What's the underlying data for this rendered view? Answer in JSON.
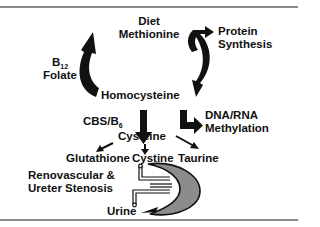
{
  "diagram": {
    "nodes": {
      "diet_line1": "Diet",
      "diet_line2": "Methionine",
      "protein_line1": "Protein",
      "protein_line2": "Synthesis",
      "b12_base": "B",
      "b12_sub": "12",
      "folate": "Folate",
      "homocysteine": "Homocysteine",
      "cbs_base": "CBS/B",
      "cbs_sub": "6",
      "dna_line1": "DNA/RNA",
      "dna_line2": "Methylation",
      "cysteine": "Cysteine",
      "glutathione": "Glutathione",
      "cystine": "Cystine",
      "taurine": "Taurine",
      "reno_line1": "Renovascular &",
      "reno_line2": "Ureter Stenosis",
      "urine": "Urine"
    },
    "edges": [
      {
        "from": "Homocysteine",
        "to": "Diet Methionine",
        "via": "B12 Folate"
      },
      {
        "from": "Diet Methionine",
        "to": "Protein Synthesis"
      },
      {
        "from": "Diet Methionine",
        "to": "Homocysteine"
      },
      {
        "from": "Homocysteine",
        "to": "DNA/RNA Methylation"
      },
      {
        "from": "Homocysteine",
        "to": "Cysteine",
        "via": "CBS/B6"
      },
      {
        "from": "Cysteine",
        "to": "Glutathione"
      },
      {
        "from": "Cysteine",
        "to": "Cystine"
      },
      {
        "from": "Cysteine",
        "to": "Taurine"
      },
      {
        "from": "Cystine",
        "to": "Urine",
        "via": "kidney"
      }
    ],
    "colors": {
      "arrow": "#111111",
      "kidney": "#8c8c8c",
      "rule": "#8a8a8a"
    }
  }
}
